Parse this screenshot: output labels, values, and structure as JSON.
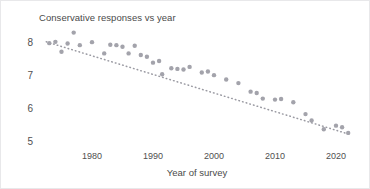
{
  "chart_data": {
    "type": "scatter",
    "title": "Conservative responses vs year",
    "xlabel": "Year of survey",
    "ylabel": "",
    "xlim": [
      1971.5,
      2023.5
    ],
    "ylim": [
      4.72,
      8.45
    ],
    "grid": false,
    "legend": null,
    "xticks": [
      1980,
      1990,
      2000,
      2010,
      2020
    ],
    "xtick_labels": [
      "1980",
      "1990",
      "2000",
      "2010",
      "2020"
    ],
    "yticks": [
      8,
      7,
      6,
      5
    ],
    "ytick_labels": [
      "8",
      "7",
      "6",
      "5"
    ],
    "marker_color": "#a3a3ab",
    "trendline": {
      "style": "dotted",
      "color": "#9a9aa2",
      "x": [
        1972.5,
        2022.5
      ],
      "y": [
        8.02,
        5.2
      ]
    },
    "points": [
      {
        "x": 1973,
        "y": 7.98
      },
      {
        "x": 1974,
        "y": 8.02
      },
      {
        "x": 1975,
        "y": 7.72
      },
      {
        "x": 1976,
        "y": 7.97
      },
      {
        "x": 1977,
        "y": 8.3
      },
      {
        "x": 1978,
        "y": 7.92
      },
      {
        "x": 1980,
        "y": 8.01
      },
      {
        "x": 1982,
        "y": 7.67
      },
      {
        "x": 1983,
        "y": 7.93
      },
      {
        "x": 1984,
        "y": 7.92
      },
      {
        "x": 1985,
        "y": 7.87
      },
      {
        "x": 1986,
        "y": 7.67
      },
      {
        "x": 1987,
        "y": 7.9
      },
      {
        "x": 1988,
        "y": 7.62
      },
      {
        "x": 1989,
        "y": 7.57
      },
      {
        "x": 1990,
        "y": 7.39
      },
      {
        "x": 1991,
        "y": 7.44
      },
      {
        "x": 1991.5,
        "y": 7.04
      },
      {
        "x": 1993,
        "y": 7.22
      },
      {
        "x": 1994,
        "y": 7.2
      },
      {
        "x": 1995,
        "y": 7.18
      },
      {
        "x": 1996,
        "y": 7.26
      },
      {
        "x": 1998,
        "y": 7.09
      },
      {
        "x": 1999,
        "y": 7.12
      },
      {
        "x": 2000,
        "y": 7.01
      },
      {
        "x": 2002,
        "y": 6.88
      },
      {
        "x": 2004,
        "y": 6.77
      },
      {
        "x": 2006,
        "y": 6.51
      },
      {
        "x": 2007,
        "y": 6.47
      },
      {
        "x": 2008,
        "y": 6.3
      },
      {
        "x": 2010,
        "y": 6.27
      },
      {
        "x": 2011,
        "y": 6.29
      },
      {
        "x": 2013,
        "y": 6.19
      },
      {
        "x": 2015,
        "y": 5.83
      },
      {
        "x": 2016,
        "y": 5.64
      },
      {
        "x": 2018,
        "y": 5.37
      },
      {
        "x": 2020,
        "y": 5.48
      },
      {
        "x": 2021,
        "y": 5.43
      },
      {
        "x": 2022,
        "y": 5.26
      }
    ]
  }
}
